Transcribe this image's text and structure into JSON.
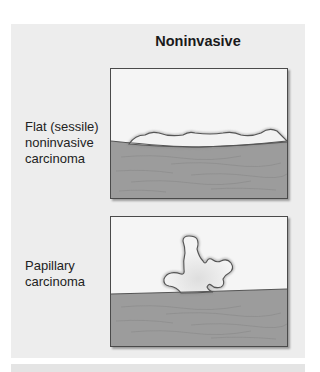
{
  "title": "Noninvasive",
  "panels": [
    {
      "id": "flat",
      "label_lines": [
        "Flat (sessile)",
        "noninvasive",
        "carcinoma"
      ],
      "illustration": "flat-sessile-tumor-on-tissue"
    },
    {
      "id": "papillary",
      "label_lines": [
        "Papillary",
        "carcinoma"
      ],
      "illustration": "papillary-tumor-on-tissue"
    }
  ],
  "colors": {
    "panel_background": "#ededed",
    "box_background": "#f5f5f5",
    "tissue": "#9c9c9c",
    "tissue_streak": "#8a8a8a",
    "tumor_fill": "#f2f2f2",
    "outline": "#555555"
  }
}
